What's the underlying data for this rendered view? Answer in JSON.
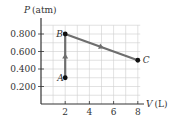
{
  "chart_data": {
    "type": "line",
    "title": "",
    "xlabel": "V (L)",
    "ylabel": "P (atm)",
    "xlabel_var": "V",
    "xlabel_unit": "(L)",
    "ylabel_var": "P",
    "ylabel_unit": "(atm)",
    "xlim": [
      0,
      8
    ],
    "ylim": [
      0,
      0.9
    ],
    "x_ticks": [
      2,
      4,
      6,
      8
    ],
    "x_tick_labels": [
      "2",
      "4",
      "6",
      "8"
    ],
    "y_ticks": [
      0.2,
      0.4,
      0.6,
      0.8
    ],
    "y_tick_labels": [
      "0.200",
      "0.400",
      "0.600",
      "0.800"
    ],
    "grid": true,
    "legend": null,
    "points": [
      {
        "label": "A",
        "x": 2,
        "y": 0.3
      },
      {
        "label": "B",
        "x": 2,
        "y": 0.8
      },
      {
        "label": "C",
        "x": 8,
        "y": 0.5
      }
    ],
    "series": [
      {
        "name": "A to B",
        "x": [
          2,
          2
        ],
        "y": [
          0.3,
          0.8
        ],
        "arrow": "up"
      },
      {
        "name": "B to C",
        "x": [
          2,
          8
        ],
        "y": [
          0.8,
          0.5
        ],
        "arrow": "right"
      }
    ],
    "colors": {
      "line": "#6e6e6e",
      "point": "#111111",
      "grid": "#c9c9c9",
      "axis": "#333333"
    }
  }
}
